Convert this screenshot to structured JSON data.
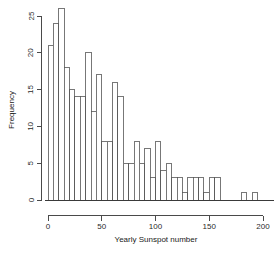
{
  "chart_data": {
    "type": "bar",
    "title": "",
    "subtitle": "",
    "xlabel": "Yearly Sunspot number",
    "ylabel": "Frequency",
    "grid": false,
    "legend": null,
    "xlim": [
      0,
      195
    ],
    "ylim": [
      0,
      26
    ],
    "bin_width": 5,
    "x_ticks": [
      0,
      50,
      100,
      150,
      200
    ],
    "x_tick_labels": [
      "0",
      "50",
      "100",
      "150",
      "200"
    ],
    "y_ticks": [
      0,
      5,
      10,
      15,
      20,
      25
    ],
    "y_tick_labels": [
      "0",
      "5",
      "10",
      "15",
      "20",
      "25"
    ],
    "bin_starts": [
      0,
      5,
      10,
      15,
      20,
      25,
      30,
      35,
      40,
      45,
      50,
      55,
      60,
      65,
      70,
      75,
      80,
      85,
      90,
      95,
      100,
      105,
      110,
      115,
      120,
      125,
      130,
      135,
      140,
      145,
      150,
      155,
      160,
      165,
      170,
      175,
      180,
      185,
      190
    ],
    "categories": [
      "0-5",
      "5-10",
      "10-15",
      "15-20",
      "20-25",
      "25-30",
      "30-35",
      "35-40",
      "40-45",
      "45-50",
      "50-55",
      "55-60",
      "60-65",
      "65-70",
      "70-75",
      "75-80",
      "80-85",
      "85-90",
      "90-95",
      "95-100",
      "100-105",
      "105-110",
      "110-115",
      "115-120",
      "120-125",
      "125-130",
      "130-135",
      "135-140",
      "140-145",
      "145-150",
      "150-155",
      "155-160",
      "160-165",
      "165-170",
      "170-175",
      "175-180",
      "180-185",
      "185-190",
      "190-195"
    ],
    "values": [
      21,
      24,
      26,
      18,
      15,
      14,
      14,
      20,
      12,
      17,
      8,
      8,
      16,
      14,
      5,
      5,
      8,
      5,
      7,
      3,
      8,
      4,
      5,
      3,
      3,
      1,
      3,
      3,
      3,
      1,
      3,
      3,
      0,
      0,
      0,
      0,
      1,
      0,
      1
    ],
    "colors": {
      "bar_fill": "#ffffff",
      "bar_stroke": "#555555",
      "axis": "#4a4a4a",
      "text": "#1a1a1a",
      "background": "#ffffff"
    }
  }
}
